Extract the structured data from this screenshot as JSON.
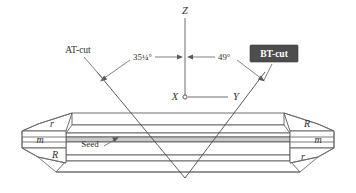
{
  "figure": {
    "colors": {
      "background": "#ffffff",
      "outline": "#5d5d5d",
      "cut_line": "#4a4a4a",
      "seed_fill": "#c9c9c9",
      "bt_box_fill": "#4d4d4d",
      "bt_box_text": "#ffffff",
      "text": "#2e2e2e"
    }
  },
  "axes": {
    "z_label": "Z",
    "x_label": "X",
    "y_label": "Y"
  },
  "angles": {
    "at": "35¼°",
    "bt": "49°"
  },
  "labels": {
    "at_cut": "AT-cut",
    "bt_cut": "BT-cut",
    "seed": "Seed"
  },
  "facets": {
    "left": [
      {
        "name": "r-face-left",
        "text": "r"
      },
      {
        "name": "m-face-left",
        "text": "m"
      },
      {
        "name": "R-face-left",
        "text": "R"
      }
    ],
    "right": [
      {
        "name": "R-face-right",
        "text": "R"
      },
      {
        "name": "m-face-right",
        "text": "m"
      },
      {
        "name": "r-face-right",
        "text": "r"
      }
    ]
  }
}
